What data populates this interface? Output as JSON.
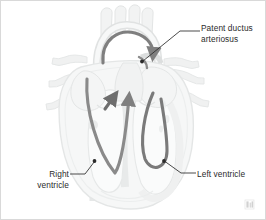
{
  "figure": {
    "background_color": "#ffffff",
    "border_color": "#d9d9d9",
    "width": 266,
    "height": 220
  },
  "labels": {
    "patent_ductus_arteriosus": "Patent ductus\narteriosus",
    "right_ventricle": "Right\nventricle",
    "left_ventricle": "Left ventricle"
  },
  "colors": {
    "text": "#2b2b2b",
    "leader_line": "#2b2b2b",
    "flow_arrow": "#7f7f7f",
    "flow_arrow_dark": "#6e6e6e",
    "anatomy_outline": "#e2e4e4",
    "anatomy_fill_light": "#f5f6f6",
    "anatomy_fill_mid": "#eceeee",
    "anatomy_fill_shadow": "#e6e8e8",
    "watermark": "#9b9b9b"
  },
  "diagram": {
    "type": "anatomical-illustration",
    "view": "anterior coronal section",
    "style": "grayscale line art with tinted fills",
    "annotations": [
      {
        "name": "patent-ductus-arteriosus",
        "label": "Patent ductus\narteriosus",
        "marker_point": [
          141,
          60
        ],
        "leader_path": "M 200 30 L 179 30 L 141 60",
        "text_anchor": "left"
      },
      {
        "name": "right-ventricle",
        "label": "Right\nventricle",
        "marker_point": [
          93,
          160
        ],
        "leader_path": "M 68 173 L 84 173 L 93 160",
        "text_anchor": "right"
      },
      {
        "name": "left-ventricle",
        "label": "Left ventricle",
        "marker_point": [
          163,
          160
        ],
        "leader_path": "M 196 172 L 180 172 L 163 160",
        "text_anchor": "left"
      }
    ],
    "flow_arrows": [
      {
        "name": "ductus-shunt-arrow",
        "description": "Curved arc from aorta over to pulmonary artery through the patent ductus arteriosus",
        "direction": "aorta-to-pulmonary-artery",
        "has_arrowhead": true
      },
      {
        "name": "right-ventricle-outflow-arrow",
        "description": "V-shaped path rising from the right ventricle toward the pulmonary artery",
        "direction": "upward",
        "has_arrowhead": true
      },
      {
        "name": "right-atrium-inflow-arrow",
        "description": "Short diagonal arrow pointing up and to the right in the mid-left chamber",
        "direction": "up-right",
        "has_arrowhead": true
      },
      {
        "name": "left-ventricle-flow-arrow",
        "description": "U-shaped path descending into and looping through the left ventricle",
        "direction": "downward-loop",
        "has_arrowhead": false
      }
    ],
    "watermark": {
      "name": "corner-watermark",
      "position": "bottom-right",
      "legible": false
    }
  }
}
